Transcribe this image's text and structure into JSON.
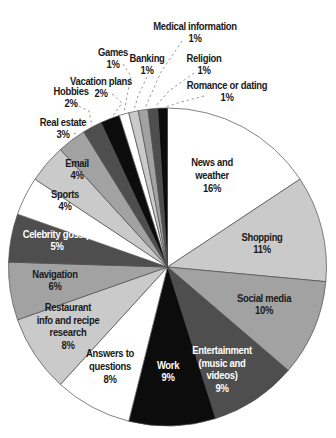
{
  "chart_data": {
    "type": "pie",
    "title": "",
    "direction": "clockwise",
    "start_angle_deg": 0,
    "legend": "none",
    "total_shown_pct": 102,
    "palette": {
      "white": "#ffffff",
      "light": "#cacaca",
      "medium": "#a2a2a2",
      "dark": "#4e4e4e",
      "black": "#0c0c0c"
    },
    "outline_color": "#4d4d4d",
    "leader_color": "#999999",
    "label_color": "#1a1a1a",
    "slices": [
      {
        "label": "News and weather",
        "pct": "16%",
        "value": 16,
        "color": "white",
        "text_color": "#1a1a1a",
        "placement": "inside",
        "lines": [
          "News and",
          "weather"
        ]
      },
      {
        "label": "Shopping",
        "pct": "11%",
        "value": 11,
        "color": "light",
        "text_color": "#1a1a1a",
        "placement": "inside",
        "lines": [
          "Shopping"
        ]
      },
      {
        "label": "Social media",
        "pct": "10%",
        "value": 10,
        "color": "medium",
        "text_color": "#1a1a1a",
        "placement": "inside",
        "lines": [
          "Social media"
        ]
      },
      {
        "label": "Entertainment (music and videos)",
        "pct": "9%",
        "value": 9,
        "color": "dark",
        "text_color": "#ffffff",
        "placement": "inside",
        "lines": [
          "Entertainment",
          "(music and",
          "videos)"
        ]
      },
      {
        "label": "Work",
        "pct": "9%",
        "value": 9,
        "color": "black",
        "text_color": "#ffffff",
        "placement": "inside",
        "lines": [
          "Work"
        ]
      },
      {
        "label": "Answers to questions",
        "pct": "8%",
        "value": 8,
        "color": "white",
        "text_color": "#1a1a1a",
        "placement": "inside",
        "lines": [
          "Answers to",
          "questions"
        ]
      },
      {
        "label": "Restaurant info and recipe research",
        "pct": "8%",
        "value": 8,
        "color": "light",
        "text_color": "#1a1a1a",
        "placement": "inside",
        "lines": [
          "Restaurant",
          "info and recipe",
          "research"
        ]
      },
      {
        "label": "Navigation",
        "pct": "6%",
        "value": 6,
        "color": "medium",
        "text_color": "#1a1a1a",
        "placement": "inside",
        "lines": [
          "Navigation"
        ]
      },
      {
        "label": "Celebrity gossip",
        "pct": "5%",
        "value": 5,
        "color": "dark",
        "text_color": "#ffffff",
        "placement": "inside",
        "lines": [
          "Celebrity gossip"
        ]
      },
      {
        "label": "Sports",
        "pct": "4%",
        "value": 4,
        "color": "white",
        "text_color": "#1a1a1a",
        "placement": "inside",
        "lines": [
          "Sports"
        ]
      },
      {
        "label": "Email",
        "pct": "4%",
        "value": 4,
        "color": "light",
        "text_color": "#1a1a1a",
        "placement": "inside",
        "lines": [
          "Email"
        ]
      },
      {
        "label": "Real estate",
        "pct": "3%",
        "value": 3,
        "color": "medium",
        "text_color": "#1a1a1a",
        "placement": "outside",
        "lines": [
          "Real estate"
        ]
      },
      {
        "label": "Hobbies",
        "pct": "2%",
        "value": 2,
        "color": "dark",
        "text_color": "#1a1a1a",
        "placement": "outside",
        "lines": [
          "Hobbies"
        ]
      },
      {
        "label": "Vacation plans",
        "pct": "2%",
        "value": 2,
        "color": "black",
        "text_color": "#1a1a1a",
        "placement": "outside",
        "lines": [
          "Vacation plans"
        ]
      },
      {
        "label": "Games",
        "pct": "1%",
        "value": 1,
        "color": "white",
        "text_color": "#1a1a1a",
        "placement": "outside",
        "lines": [
          "Games"
        ]
      },
      {
        "label": "Banking",
        "pct": "1%",
        "value": 1,
        "color": "light",
        "text_color": "#1a1a1a",
        "placement": "outside",
        "lines": [
          "Banking"
        ]
      },
      {
        "label": "Medical information",
        "pct": "1%",
        "value": 1,
        "color": "medium",
        "text_color": "#1a1a1a",
        "placement": "outside",
        "lines": [
          "Medical information"
        ]
      },
      {
        "label": "Religion",
        "pct": "1%",
        "value": 1,
        "color": "dark",
        "text_color": "#1a1a1a",
        "placement": "outside",
        "lines": [
          "Religion"
        ]
      },
      {
        "label": "Romance or dating",
        "pct": "1%",
        "value": 1,
        "color": "black",
        "text_color": "#1a1a1a",
        "placement": "outside",
        "lines": [
          "Romance or dating"
        ]
      }
    ]
  }
}
